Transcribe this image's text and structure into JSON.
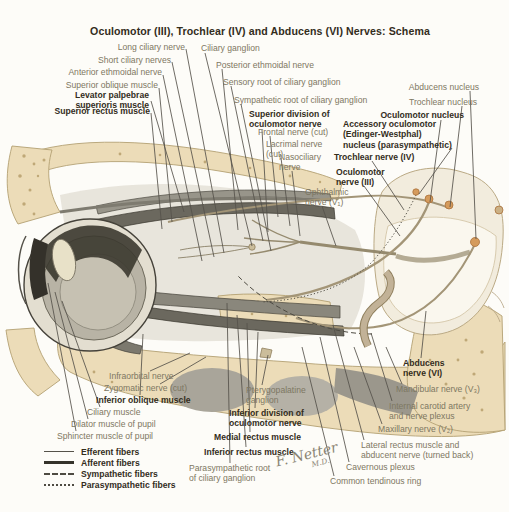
{
  "title": "Oculomotor (III), Trochlear (IV) and Abducens (VI) Nerves: Schema",
  "colors": {
    "background": "#fdfcf8",
    "bone": "#ecdcb8",
    "label_text": "#7d7762",
    "emphasis_text": "#332d1c",
    "nucleus_dot": "#d59b5c",
    "leader_line": "#55524a"
  },
  "labels": [
    {
      "text": "Long ciliary nerve"
    },
    {
      "text": "Ciliary ganglion"
    },
    {
      "text": "Short ciliary nerves"
    },
    {
      "text": "Posterior ethmoidal nerve"
    },
    {
      "text": "Anterior ethmoidal nerve"
    },
    {
      "text": "Sensory root of ciliary ganglion"
    },
    {
      "text": "Superior oblique muscle"
    },
    {
      "text": "Levator palpebrae\nsuperioris muscle"
    },
    {
      "text": "Sympathetic root of ciliary ganglion"
    },
    {
      "text": "Superior rectus muscle"
    },
    {
      "text": "Abducens nucleus"
    },
    {
      "text": "Trochlear nucleus"
    },
    {
      "text": "Oculomotor nucleus"
    },
    {
      "text": "Superior division of\noculomotor nerve"
    },
    {
      "text": "Accessory oculomotor\n(Edinger-Westphal)\nnucleus (parasympathetic)"
    },
    {
      "text": "Frontal nerve (cut)"
    },
    {
      "text": "Lacrimal nerve\n(cut)"
    },
    {
      "text": "Trochlear nerve (IV)"
    },
    {
      "text": "Nasociliary\nnerve"
    },
    {
      "text": "Oculomotor\nnerve (III)"
    },
    {
      "text": "Ophthalmic\nnerve (V₁)"
    },
    {
      "text": "Infraorbital nerve"
    },
    {
      "text": "Zygomatic nerve (cut)"
    },
    {
      "text": "Inferior oblique muscle"
    },
    {
      "text": "Ciliary muscle"
    },
    {
      "text": "Dilator muscle of pupil"
    },
    {
      "text": "Sphincter muscle of pupil"
    },
    {
      "text": "Pterygopalatine\nganglion"
    },
    {
      "text": "Inferior division of\noculomotor nerve"
    },
    {
      "text": "Medial rectus muscle"
    },
    {
      "text": "Inferior rectus muscle"
    },
    {
      "text": "Parasympathetic root\nof ciliary ganglion"
    },
    {
      "text": "Abducens\nnerve (VI)"
    },
    {
      "text": "Mandibular nerve (V₃)"
    },
    {
      "text": "Internal carotid artery\nand nerve plexus"
    },
    {
      "text": "Maxillary nerve (V₂)"
    },
    {
      "text": "Lateral rectus muscle and\nabducent nerve (turned back)"
    },
    {
      "text": "Cavernous plexus"
    },
    {
      "text": "Common tendinous ring"
    }
  ],
  "legend": {
    "items": [
      "Efferent fibers",
      "Afferent fibers",
      "Sympathetic fibers",
      "Parasympathetic fibers"
    ]
  },
  "signature": {
    "name": "F. Netter",
    "suffix": "M.D."
  }
}
